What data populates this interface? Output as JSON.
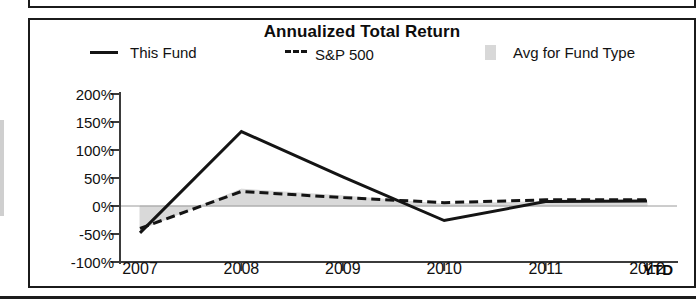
{
  "chart_data": {
    "type": "line",
    "title": "Annualized Total Return",
    "xlabel": "",
    "ylabel": "",
    "x": [
      "2007",
      "2008",
      "2009",
      "2010",
      "2011",
      "2012"
    ],
    "x_unit_label": "YTD",
    "ylim": [
      -100,
      200
    ],
    "ytick_labels": [
      "200%",
      "150%",
      "100%",
      "50%",
      "0%",
      "-50%",
      "-100%"
    ],
    "ytick_values": [
      200,
      150,
      100,
      50,
      0,
      -50,
      -100
    ],
    "grid": false,
    "legend_position": "top",
    "series": [
      {
        "name": "This Fund",
        "style": "solid",
        "color": "#141414",
        "values": [
          -48,
          133,
          52,
          -26,
          8,
          9
        ]
      },
      {
        "name": "S&P 500",
        "style": "dashed",
        "color": "#141414",
        "values": [
          -40,
          26,
          15,
          6,
          11,
          11
        ]
      },
      {
        "name": "Avg for Fund Type",
        "style": "area",
        "color": "#d8d8d8",
        "values": [
          -42,
          30,
          18,
          3,
          8,
          8
        ]
      }
    ]
  },
  "chart": {
    "title": "Annualized Total Return",
    "legend": [
      {
        "label": "This Fund",
        "marker": "solid-line-swatch"
      },
      {
        "label": "S&P 500",
        "marker": "dashed-line-swatch"
      },
      {
        "label": "Avg for Fund Type",
        "marker": "gray-box-swatch"
      }
    ],
    "y_axis": {
      "ticks": [
        "200%",
        "150%",
        "100%",
        "50%",
        "0%",
        "-50%",
        "-100%"
      ]
    },
    "x_axis": {
      "ticks": [
        "2007",
        "2008",
        "2009",
        "2010",
        "2011",
        "2012"
      ],
      "unit": "YTD"
    }
  }
}
